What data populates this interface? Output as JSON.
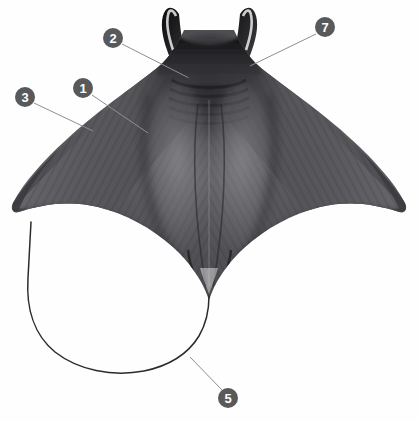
{
  "figure": {
    "image_type": "x-ray radiograph",
    "background_color": "#fefefe",
    "width": 419,
    "height": 422
  },
  "style": {
    "callout_circle_color": "#58595b",
    "callout_text_color": "#ffffff",
    "leader_line_color": "#8d8f91",
    "body_dark": "#3f3f41",
    "body_mid": "#5c5c5e",
    "body_light": "#86868a",
    "body_shadow": "#1d1d1f",
    "tail_color": "#2b2b2d"
  },
  "callouts": [
    {
      "id": "callout-1",
      "label": "1",
      "circle": {
        "cx": 83,
        "cy": 88,
        "r": 10
      },
      "leader": {
        "x1": 92,
        "y1": 95,
        "x2": 148,
        "y2": 133
      }
    },
    {
      "id": "callout-2",
      "label": "2",
      "circle": {
        "cx": 113,
        "cy": 38,
        "r": 10
      },
      "leader": {
        "x1": 122,
        "y1": 44,
        "x2": 189,
        "y2": 78
      },
      "dot": {
        "cx": 190,
        "cy": 79,
        "r": 2.2
      }
    },
    {
      "id": "callout-3",
      "label": "3",
      "circle": {
        "cx": 25,
        "cy": 97,
        "r": 10
      },
      "leader": {
        "x1": 34,
        "y1": 103,
        "x2": 93,
        "y2": 131
      }
    },
    {
      "id": "callout-5",
      "label": "5",
      "circle": {
        "cx": 228,
        "cy": 398,
        "r": 10
      },
      "leader": {
        "x1": 222,
        "y1": 390,
        "x2": 190,
        "y2": 357
      }
    },
    {
      "id": "callout-7",
      "label": "7",
      "circle": {
        "cx": 325,
        "cy": 27,
        "r": 10
      },
      "leader": {
        "x1": 316,
        "y1": 34,
        "x2": 250,
        "y2": 66
      }
    }
  ],
  "anatomy_paths": {
    "body_outline": "M209,22 C206,8 200,2 194,3 C188,4 185,12 186,22 C187,36 191,52 188,62 C185,72 176,78 166,85 C150,96 120,118 90,145 C60,172 30,198 14,211 C12,213 13,216 17,215 C40,211 72,212 100,226 C128,240 152,260 176,285 C190,300 198,312 203,322 L209,322 Z",
    "tail": "M30,222 C25,260 30,300 55,330 C80,360 125,378 165,372 C185,369 200,358 207,340 C214,322 212,305 209,295",
    "left_cephalic": "M196,5 C191,3 186,8 185,18 C184,30 188,46 187,58",
    "right_cephalic": "M223,5 C228,3 233,8 234,18 C235,30 231,46 232,58"
  }
}
